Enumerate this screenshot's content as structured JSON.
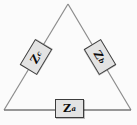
{
  "diagram": {
    "shape": "triangle",
    "colors": {
      "background": "#fbfbfb",
      "wire_side": "#8c8c8c",
      "wire_bottom": "#767676",
      "box_fill": "#e3e3e3",
      "box_border": "#3d3d3d",
      "label_text": "#0a0a0a"
    },
    "impedances": [
      {
        "symbol": "Z",
        "subscript": "a",
        "position": "bottom"
      },
      {
        "symbol": "Z",
        "subscript": "b",
        "position": "right-side"
      },
      {
        "symbol": "Z",
        "subscript": "c",
        "position": "left-side"
      }
    ]
  }
}
